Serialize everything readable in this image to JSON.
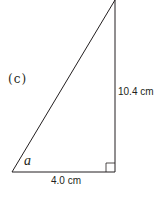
{
  "figure": {
    "part_label": "(c)",
    "angle_label": "a",
    "right_side_label": "10.4 cm",
    "bottom_side_label": "4.0 cm",
    "colors": {
      "stroke": "#231f20",
      "background": "#ffffff"
    },
    "triangle": {
      "type": "right triangle",
      "vertices": {
        "apex": [
          115,
          0
        ],
        "bottom_left": [
          12,
          172
        ],
        "right_angle": [
          115,
          172
        ]
      },
      "right_angle_marker_size": 9
    }
  }
}
